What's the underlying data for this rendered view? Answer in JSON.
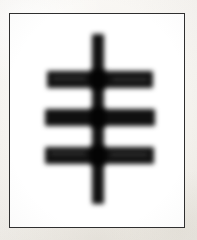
{
  "image": {
    "kind": "scanned-glyph-image",
    "width_px": 197,
    "height_px": 240,
    "background_color": "#f7f5f1",
    "alt_text": "Blurry scanned image of a dark glyph: one vertical stroke crossed by three horizontal bars, inside a thin rectangular frame on off-white paper."
  },
  "frame": {
    "label": "rectangular border",
    "left_px": 9,
    "top_px": 13,
    "width_px": 176,
    "height_px": 215,
    "border_color": "#2e2e2e",
    "border_width_px": 1.5,
    "fill_color": "#ffffff"
  },
  "glyph": {
    "label": "three-barred vertical stroke glyph",
    "ink_color": "#161616",
    "junction_color": "#0b0b0b",
    "blur_px": 2.4,
    "stroke_count": 4,
    "bar_count": 3,
    "strokes": [
      {
        "name": "vertical-stroke",
        "orientation": "vertical",
        "left_px": 92,
        "top_px": 34,
        "width_px": 12,
        "height_px": 170
      },
      {
        "name": "horizontal-bar-top",
        "orientation": "horizontal",
        "left_px": 47,
        "top_px": 71,
        "width_px": 106,
        "height_px": 17
      },
      {
        "name": "horizontal-bar-middle",
        "orientation": "horizontal",
        "left_px": 45,
        "top_px": 109,
        "width_px": 110,
        "height_px": 17
      },
      {
        "name": "horizontal-bar-bottom",
        "orientation": "horizontal",
        "left_px": 45,
        "top_px": 147,
        "width_px": 109,
        "height_px": 17
      }
    ],
    "junctions": [
      {
        "name": "junction-top",
        "left_px": 90,
        "top_px": 69,
        "width_px": 16,
        "height_px": 21
      },
      {
        "name": "junction-middle",
        "left_px": 90,
        "top_px": 107,
        "width_px": 16,
        "height_px": 21
      },
      {
        "name": "junction-bottom",
        "left_px": 90,
        "top_px": 145,
        "width_px": 16,
        "height_px": 21
      }
    ]
  }
}
